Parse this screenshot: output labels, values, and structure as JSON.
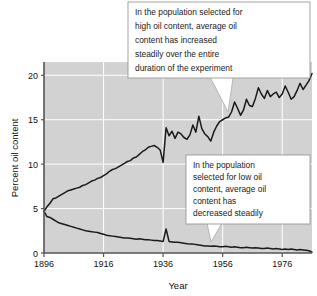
{
  "chart_data": {
    "type": "line",
    "title": "",
    "xlabel": "Year",
    "ylabel": "Percent oil content",
    "xlim": [
      1896,
      1986
    ],
    "ylim": [
      0,
      21.5
    ],
    "xticks": [
      1896,
      1916,
      1936,
      1956,
      1976
    ],
    "yticks": [
      0,
      5,
      10,
      15,
      20
    ],
    "grid": true,
    "legend": "none",
    "plot_background": "#d2d2d2",
    "gridline_color": "#ffffff",
    "line_color": "#1a1a1a",
    "series": [
      {
        "name": "Illinois High Oil",
        "x": [
          1896,
          1897,
          1898,
          1899,
          1900,
          1901,
          1902,
          1903,
          1904,
          1905,
          1906,
          1907,
          1908,
          1909,
          1910,
          1911,
          1912,
          1913,
          1914,
          1915,
          1916,
          1917,
          1918,
          1919,
          1920,
          1921,
          1922,
          1923,
          1924,
          1925,
          1926,
          1927,
          1928,
          1929,
          1930,
          1931,
          1932,
          1933,
          1934,
          1935,
          1936,
          1937,
          1938,
          1939,
          1940,
          1941,
          1942,
          1943,
          1944,
          1945,
          1946,
          1947,
          1948,
          1949,
          1950,
          1951,
          1952,
          1953,
          1954,
          1955,
          1956,
          1957,
          1958,
          1959,
          1960,
          1961,
          1962,
          1963,
          1964,
          1965,
          1966,
          1967,
          1968,
          1969,
          1970,
          1971,
          1972,
          1973,
          1974,
          1975,
          1976,
          1977,
          1978,
          1979,
          1980,
          1981,
          1982,
          1983,
          1984,
          1985,
          1986
        ],
        "values": [
          4.7,
          5.2,
          5.6,
          6.1,
          6.2,
          6.4,
          6.6,
          6.8,
          7.0,
          7.1,
          7.2,
          7.3,
          7.4,
          7.6,
          7.7,
          7.9,
          8.1,
          8.2,
          8.4,
          8.5,
          8.7,
          8.9,
          9.2,
          9.4,
          9.5,
          9.7,
          9.9,
          10.1,
          10.3,
          10.4,
          10.7,
          10.8,
          11.1,
          11.4,
          11.6,
          11.9,
          12.0,
          12.1,
          11.9,
          11.6,
          10.2,
          14.1,
          13.2,
          13.7,
          12.9,
          13.6,
          13.4,
          13.0,
          12.8,
          13.3,
          14.4,
          13.6,
          15.4,
          14.0,
          13.4,
          13.1,
          12.6,
          13.6,
          14.3,
          14.8,
          15.0,
          15.2,
          15.3,
          15.9,
          17.0,
          16.3,
          15.5,
          16.1,
          17.3,
          16.6,
          16.5,
          17.4,
          18.6,
          17.9,
          17.4,
          18.3,
          17.6,
          17.9,
          18.1,
          17.5,
          17.9,
          18.8,
          18.1,
          17.3,
          17.6,
          18.3,
          19.1,
          18.4,
          18.9,
          19.4,
          20.2
        ]
      },
      {
        "name": "Illinois Low Oil",
        "x": [
          1896,
          1897,
          1898,
          1899,
          1900,
          1901,
          1902,
          1903,
          1904,
          1905,
          1906,
          1907,
          1908,
          1909,
          1910,
          1911,
          1912,
          1913,
          1914,
          1915,
          1916,
          1917,
          1918,
          1919,
          1920,
          1921,
          1922,
          1923,
          1924,
          1925,
          1926,
          1927,
          1928,
          1929,
          1930,
          1931,
          1932,
          1933,
          1934,
          1935,
          1936,
          1937,
          1938,
          1939,
          1940,
          1941,
          1942,
          1943,
          1944,
          1945,
          1946,
          1947,
          1948,
          1949,
          1950,
          1951,
          1952,
          1953,
          1954,
          1955,
          1956,
          1957,
          1958,
          1959,
          1960,
          1961,
          1962,
          1963,
          1964,
          1965,
          1966,
          1967,
          1968,
          1969,
          1970,
          1971,
          1972,
          1973,
          1974,
          1975,
          1976,
          1977,
          1978,
          1979,
          1980,
          1981,
          1982,
          1983,
          1984,
          1985,
          1986
        ],
        "values": [
          4.7,
          4.1,
          4.0,
          3.8,
          3.6,
          3.4,
          3.3,
          3.2,
          3.1,
          3.0,
          2.9,
          2.8,
          2.7,
          2.6,
          2.5,
          2.45,
          2.4,
          2.35,
          2.3,
          2.2,
          2.1,
          2.0,
          1.95,
          1.9,
          1.85,
          1.8,
          1.75,
          1.7,
          1.7,
          1.65,
          1.6,
          1.55,
          1.6,
          1.55,
          1.5,
          1.5,
          1.45,
          1.4,
          1.4,
          1.35,
          1.3,
          2.7,
          1.3,
          1.25,
          1.2,
          1.2,
          1.15,
          1.1,
          1.05,
          1.0,
          1.0,
          0.95,
          0.9,
          0.85,
          0.8,
          0.8,
          0.75,
          0.8,
          0.75,
          0.7,
          0.7,
          0.75,
          0.7,
          0.65,
          0.7,
          0.65,
          0.6,
          0.6,
          0.65,
          0.6,
          0.55,
          0.6,
          0.55,
          0.5,
          0.5,
          0.55,
          0.5,
          0.45,
          0.5,
          0.45,
          0.4,
          0.45,
          0.4,
          0.45,
          0.4,
          0.35,
          0.4,
          0.35,
          0.3,
          0.25,
          0.1
        ]
      }
    ],
    "annotations": [
      {
        "id": "high-callout",
        "lines": [
          "In the population selected for",
          "high oil content, average oil",
          "content has increased",
          "steadily over the entire",
          "duration of the experiment"
        ]
      },
      {
        "id": "low-callout",
        "lines": [
          "In the population",
          "selected for low oil",
          "content, average oil",
          "content has",
          "decreased steadily"
        ]
      }
    ]
  }
}
